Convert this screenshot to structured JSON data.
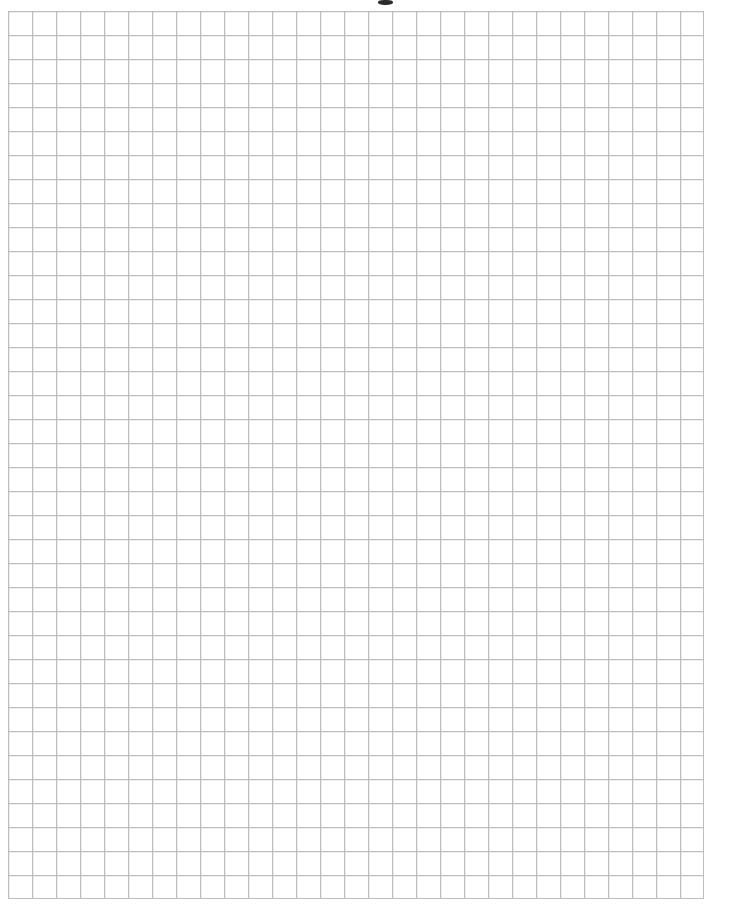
{
  "document": {
    "kind": "graph-paper-sheet",
    "description": "Blank scanned quadrille / graph paper grid sheet",
    "page_width_px": 735,
    "page_height_px": 905,
    "background_color": "#ffffff",
    "content_text": "",
    "visible_labels": []
  },
  "grid": {
    "origin_x_px": 8,
    "origin_y_px": 11,
    "cell_size_px": 24,
    "columns": 29,
    "rows": 37,
    "width_px": 696,
    "height_px": 888,
    "line_color": "#c3c3c3",
    "line_color_strong": "#b4b4b4",
    "line_width_px": 1,
    "border_color": "#bdbdbd",
    "has_major_gridlines": false,
    "has_axis_labels": false,
    "has_tick_labels": false,
    "is_blank": true
  },
  "margins": {
    "left_px": 8,
    "top_px": 11,
    "right_px": 31,
    "bottom_px": 5,
    "margin_color": "#ffffff"
  },
  "artifacts": {
    "top_clipped_mark": {
      "present": true,
      "x_px": 378,
      "y_px": 0,
      "width_px": 15,
      "height_px": 5,
      "color": "#2b2b2b",
      "note": "clipped descender of text above the frame"
    }
  }
}
